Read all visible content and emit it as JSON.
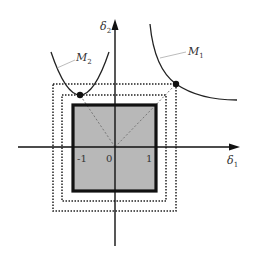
{
  "diagram": {
    "axes": {
      "x_label": {
        "main": "δ",
        "sub": "1"
      },
      "y_label": {
        "main": "δ",
        "sub": "2"
      },
      "ticks": [
        {
          "text": "-1"
        },
        {
          "text": "0"
        },
        {
          "text": "1"
        }
      ]
    },
    "curves": {
      "m1": {
        "label_main": "M",
        "label_sub": "1"
      },
      "m2": {
        "label_main": "M",
        "label_sub": "2"
      }
    },
    "colors": {
      "fill_square": "#b8b8b8",
      "stroke": "#111111",
      "dotted": "#222222",
      "dashed_diag": "#777777",
      "leader": "#aaaaaa",
      "background": "#ffffff"
    }
  }
}
